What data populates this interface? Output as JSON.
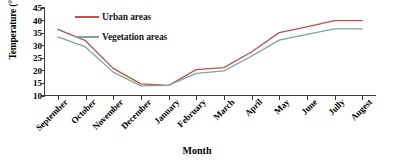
{
  "chart_data": {
    "type": "line",
    "title": "",
    "xlabel": "Month",
    "ylabel": "Temperature (°C)",
    "categories": [
      "September",
      "October",
      "November",
      "December",
      "January",
      "February",
      "March",
      "April",
      "May",
      "June",
      "Jully",
      "Augest"
    ],
    "ylim": [
      10,
      45
    ],
    "yticks": [
      10,
      15,
      20,
      25,
      30,
      35,
      40,
      45
    ],
    "grid": false,
    "legend_position": "inside-upper-left",
    "series": [
      {
        "name": "Urban areas",
        "color": "#c0504d",
        "values": [
          36.5,
          32.0,
          21.0,
          14.8,
          14.2,
          20.5,
          21.3,
          27.5,
          35.2,
          37.5,
          40.0,
          40.0
        ]
      },
      {
        "name": "Vegetation areas",
        "color": "#7da798",
        "values": [
          33.5,
          29.5,
          19.5,
          14.0,
          14.2,
          19.0,
          20.0,
          25.8,
          32.2,
          34.5,
          36.7,
          36.7
        ]
      }
    ]
  }
}
